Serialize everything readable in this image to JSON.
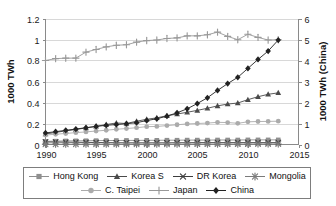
{
  "chart_data": {
    "type": "line",
    "title": "",
    "xlabel": "",
    "ylabel": "1000 TWh",
    "y2label": "1000 TWh (China)",
    "xlim": [
      1990,
      2015
    ],
    "ylim": [
      0,
      1.2
    ],
    "y2lim": [
      0,
      6
    ],
    "grid": true,
    "legend_position": "bottom",
    "x_ticks": [
      "1990",
      "1995",
      "2000",
      "2005",
      "2010",
      "2015"
    ],
    "x_tick_values": [
      1990,
      1995,
      2000,
      2005,
      2010,
      2015
    ],
    "y_ticks": [
      "0",
      "0.2",
      "0.4",
      "0.6",
      "0.8",
      "1",
      "1.2"
    ],
    "y_tick_values": [
      0,
      0.2,
      0.4,
      0.6,
      0.8,
      1.0,
      1.2
    ],
    "y2_ticks": [
      "0",
      "1",
      "2",
      "3",
      "4",
      "5",
      "6"
    ],
    "y2_tick_values": [
      0,
      1,
      2,
      3,
      4,
      5,
      6
    ],
    "x": [
      1990,
      1991,
      1992,
      1993,
      1994,
      1995,
      1996,
      1997,
      1998,
      1999,
      2000,
      2001,
      2002,
      2003,
      2004,
      2005,
      2006,
      2007,
      2008,
      2009,
      2010,
      2011,
      2012,
      2013
    ],
    "series": [
      {
        "name": "Hong Kong",
        "marker": "square",
        "color": "#8f8f8f",
        "axis": "left",
        "values": [
          0.03,
          0.032,
          0.034,
          0.035,
          0.036,
          0.037,
          0.038,
          0.038,
          0.039,
          0.039,
          0.04,
          0.04,
          0.041,
          0.041,
          0.042,
          0.042,
          0.042,
          0.043,
          0.043,
          0.043,
          0.044,
          0.044,
          0.044,
          0.044
        ]
      },
      {
        "name": "Korea S",
        "marker": "triangle",
        "color": "#4a4a4a",
        "axis": "left",
        "values": [
          0.1,
          0.115,
          0.13,
          0.143,
          0.158,
          0.173,
          0.19,
          0.205,
          0.2,
          0.222,
          0.24,
          0.254,
          0.274,
          0.29,
          0.307,
          0.325,
          0.345,
          0.368,
          0.385,
          0.395,
          0.427,
          0.455,
          0.478,
          0.492
        ]
      },
      {
        "name": "DR Korea",
        "marker": "cross-x",
        "color": "#3d3d3d",
        "axis": "left",
        "values": [
          0.024,
          0.023,
          0.022,
          0.021,
          0.02,
          0.019,
          0.018,
          0.017,
          0.016,
          0.016,
          0.016,
          0.016,
          0.016,
          0.017,
          0.017,
          0.018,
          0.018,
          0.018,
          0.018,
          0.018,
          0.018,
          0.018,
          0.018,
          0.018
        ]
      },
      {
        "name": "Mongolia",
        "marker": "asterisk",
        "color": "#7a7a7a",
        "axis": "left",
        "values": [
          0.003,
          0.003,
          0.003,
          0.003,
          0.003,
          0.003,
          0.003,
          0.003,
          0.003,
          0.003,
          0.003,
          0.003,
          0.003,
          0.003,
          0.003,
          0.004,
          0.004,
          0.004,
          0.004,
          0.004,
          0.004,
          0.005,
          0.005,
          0.005
        ]
      },
      {
        "name": "C. Taipei",
        "marker": "circle",
        "color": "#ababab",
        "axis": "left",
        "values": [
          0.09,
          0.098,
          0.105,
          0.113,
          0.12,
          0.128,
          0.136,
          0.145,
          0.152,
          0.16,
          0.17,
          0.172,
          0.18,
          0.188,
          0.196,
          0.2,
          0.204,
          0.211,
          0.209,
          0.202,
          0.216,
          0.219,
          0.22,
          0.222
        ]
      },
      {
        "name": "Japan",
        "marker": "plus",
        "color": "#999999",
        "axis": "left",
        "values": [
          0.8,
          0.818,
          0.822,
          0.823,
          0.88,
          0.905,
          0.93,
          0.945,
          0.95,
          0.975,
          0.99,
          0.995,
          1.01,
          1.015,
          1.035,
          1.035,
          1.045,
          1.07,
          1.03,
          0.998,
          1.05,
          1.02,
          0.995,
          0.998
        ]
      },
      {
        "name": "China",
        "marker": "diamond",
        "color": "#222222",
        "axis": "right",
        "values": [
          0.11,
          0.122,
          0.135,
          0.147,
          0.16,
          0.172,
          0.183,
          0.19,
          0.198,
          0.208,
          0.228,
          0.245,
          0.27,
          0.302,
          0.34,
          0.39,
          0.445,
          0.515,
          0.58,
          0.64,
          0.725,
          0.81,
          0.89,
          0.995
        ]
      }
    ]
  },
  "axes": {
    "left_title": "1000 TWh",
    "right_title": "1000 TWh (China)"
  },
  "legend": {
    "rows": [
      [
        {
          "label": "Hong Kong",
          "marker": "square",
          "color": "#8f8f8f"
        },
        {
          "label": "Korea S",
          "marker": "triangle",
          "color": "#4a4a4a"
        },
        {
          "label": "DR Korea",
          "marker": "cross-x",
          "color": "#3d3d3d"
        },
        {
          "label": "Mongolia",
          "marker": "asterisk",
          "color": "#7a7a7a"
        }
      ],
      [
        {
          "label": "C. Taipei",
          "marker": "circle",
          "color": "#ababab"
        },
        {
          "label": "Japan",
          "marker": "plus",
          "color": "#999999"
        },
        {
          "label": "China",
          "marker": "diamond",
          "color": "#222222"
        }
      ]
    ]
  }
}
